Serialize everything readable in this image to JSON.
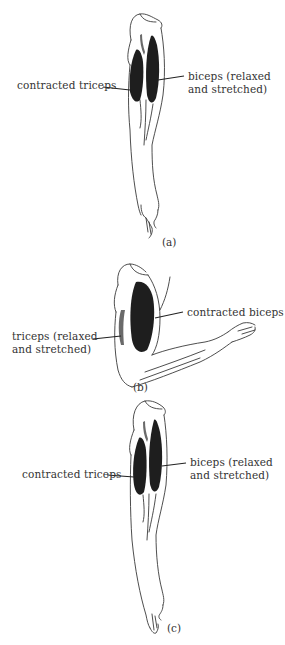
{
  "figure": {
    "panels": [
      {
        "id": "a",
        "caption": "(a)",
        "pose": "arm extended downward",
        "labels": {
          "left": "contracted triceps",
          "right_line1": "biceps (relaxed",
          "right_line2": "and stretched)"
        }
      },
      {
        "id": "b",
        "caption": "(b)",
        "pose": "arm flexed at elbow, forearm horizontal",
        "labels": {
          "right": "contracted biceps",
          "left_line1": "triceps (relaxed",
          "left_line2": "and stretched)"
        }
      },
      {
        "id": "c",
        "caption": "(c)",
        "pose": "arm extended downward",
        "labels": {
          "left": "contracted triceps",
          "right_line1": "biceps (relaxed",
          "right_line2": "and stretched)"
        }
      }
    ],
    "colors": {
      "background": "#ffffff",
      "ink": "#2a2a2a"
    }
  }
}
